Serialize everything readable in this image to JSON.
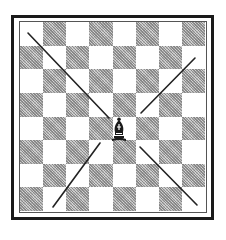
{
  "diagram": {
    "type": "chess-board-diagram",
    "board": {
      "rows": 8,
      "cols": 8,
      "top_left_color": "light",
      "light_color": "#ffffff",
      "dark_color": "#b9b9b9",
      "frame_color": "#1a1a1a"
    },
    "piece": {
      "type": "bishop",
      "color": "black",
      "square": {
        "row": 4,
        "col": 4
      },
      "glyph": "♝"
    },
    "arrows": [
      {
        "name": "arrow-northwest",
        "direction": "up-left",
        "from": [
          109,
          118
        ],
        "to": [
          28,
          33
        ]
      },
      {
        "name": "arrow-northeast",
        "direction": "up-right",
        "from": [
          141,
          113
        ],
        "to": [
          195,
          58
        ]
      },
      {
        "name": "arrow-southwest",
        "direction": "down-left",
        "from": [
          100,
          143
        ],
        "to": [
          53,
          207
        ]
      },
      {
        "name": "arrow-southeast",
        "direction": "down-right",
        "from": [
          140,
          147
        ],
        "to": [
          197,
          205
        ]
      }
    ],
    "arrow_color": "#222222"
  }
}
